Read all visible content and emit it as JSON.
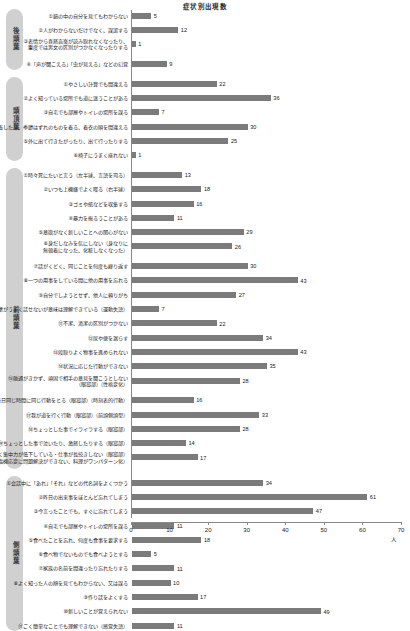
{
  "chart_data": {
    "type": "bar",
    "title": "症状別出現数",
    "xlabel": "人",
    "ylabel": "",
    "xlim": [
      0,
      70
    ],
    "xticks": [
      0,
      10,
      20,
      30,
      40,
      50,
      60,
      70
    ],
    "grid": false,
    "legend": null,
    "orientation": "horizontal",
    "unit": "人",
    "groups": [
      {
        "name": "後頭葉",
        "items": [
          {
            "label": "①鏡の中の自分を見てもわからない",
            "value": 5
          },
          {
            "label": "②人がわからないだけでなく、誤認する",
            "value": 12
          },
          {
            "label": "③表情から喜怒哀楽が読み取れなくなったり、\n重度では男女の区別がつかなくなったりする",
            "value": 1
          },
          {
            "label": "④「声が聞こえる」「虫が見える」などの幻覚",
            "value": 9
          }
        ]
      },
      {
        "name": "頭頂葉",
        "items": [
          {
            "label": "①やさしい計算でも間違える",
            "value": 22
          },
          {
            "label": "②よく知っている場所でも道に迷うことがある",
            "value": 36
          },
          {
            "label": "③自宅でも部屋やトイレの場所を誤る",
            "value": 7
          },
          {
            "label": "④重ね着したり、季節はずれのものを着る、着衣の順を間違える",
            "value": 30
          },
          {
            "label": "⑤外に出て行きたがったり、出て行ったりする",
            "value": 25
          },
          {
            "label": "⑥椅子にうまく座れない",
            "value": 1
          }
        ]
      },
      {
        "name": "前頭葉",
        "items": [
          {
            "label": "①時々死にたいと言う（左半球、言語を司る）",
            "value": 13
          },
          {
            "label": "②いつも上機嫌でよく喋る（右半球）",
            "value": 18
          },
          {
            "label": "③ゴミや紙などを収集する",
            "value": 16
          },
          {
            "label": "④暴力を振るうことがある",
            "value": 11
          },
          {
            "label": "⑤意欲がなく新しいことへの関心がない",
            "value": 29
          },
          {
            "label": "⑥身だしなみを気にしない（身なりに\n無頓着になった、化粧しなくなった）",
            "value": 26
          },
          {
            "label": "⑦話がくどく、同じことを何度も繰り返す",
            "value": 30
          },
          {
            "label": "⑧一つの用事をしている間に他の用事を忘れる",
            "value": 43
          },
          {
            "label": "⑨自分でしようとせず、他人に頼りがち",
            "value": 27
          },
          {
            "label": "⑩言葉がうまく話せないが意味は理解できている（運動失語）",
            "value": 7
          },
          {
            "label": "⑪不潔、清潔の区別がつかない",
            "value": 22
          },
          {
            "label": "⑫尿や便を漏らす",
            "value": 34
          },
          {
            "label": "⑬段取りよく物事を進められない",
            "value": 43
          },
          {
            "label": "⑭状況に応じた行動ができない",
            "value": 35
          },
          {
            "label": "⑮融通がきかず、頑固で相手の意見を聞こうとしない\n（眼窩部）（性格変化）",
            "value": 28
          },
          {
            "label": "⑯毎日同じ時間に同じ行動をとる（眼窩部）（時刻表的行動）",
            "value": 16
          },
          {
            "label": "⑰我が道を行く行動（眼窩部）（前頭側頭型）",
            "value": 33
          },
          {
            "label": "⑱ちょっとした事でイライラする（眼窩部）",
            "value": 28
          },
          {
            "label": "⑲ちょっとした事で泣いたり、激怒したりする（眼窩部）",
            "value": 14
          },
          {
            "label": "⑳忍耐力がなく集中力が低下している・仕事が長続きしない（眼窩部）\n（臨機応変に問題解決ができない、料理がワンパターン化）",
            "value": 17
          }
        ]
      },
      {
        "name": "側頭葉",
        "items": [
          {
            "label": "①会話中に「あれ」「それ」などの代名詞をよくつかう",
            "value": 34
          },
          {
            "label": "②昨日の出来事をほとんど忘れてしまう",
            "value": 61
          },
          {
            "label": "③今言ったことでも、すぐに忘れてしまう",
            "value": 47
          },
          {
            "label": "④自宅でも部屋やトイレの場所を誤る",
            "value": 11
          },
          {
            "label": "⑤食べたことを忘れ、何度も食事を要求する",
            "value": 18
          },
          {
            "label": "⑥食べ物でないものでも食べようとする",
            "value": 5
          },
          {
            "label": "⑦家族の名前を間違ったり忘れたりする",
            "value": 11
          },
          {
            "label": "⑧よく知った人の顔を見てもわからない、又は誤る",
            "value": 10
          },
          {
            "label": "⑨作り話をよくする",
            "value": 17
          },
          {
            "label": "⑩新しいことが覚えられない",
            "value": 49
          },
          {
            "label": "⑪ごく簡単なことでも理解できない（感覚失語）",
            "value": 11
          }
        ]
      }
    ]
  },
  "colors": {
    "bar": "#7b7b7b",
    "pill": "#d0d0d0",
    "axis": "#8a8a8a",
    "text": "#1a1a1a"
  }
}
